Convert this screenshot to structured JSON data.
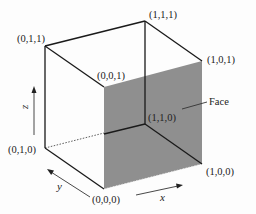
{
  "diagram": {
    "type": "unit-cube",
    "vertices": [
      {
        "id": "v000",
        "label": "(0,0,0)"
      },
      {
        "id": "v100",
        "label": "(1,0,0)"
      },
      {
        "id": "v010",
        "label": "(0,1,0)"
      },
      {
        "id": "v110",
        "label": "(1,1,0)"
      },
      {
        "id": "v001",
        "label": "(0,0,1)"
      },
      {
        "id": "v101",
        "label": "(1,0,1)"
      },
      {
        "id": "v011",
        "label": "(0,1,1)"
      },
      {
        "id": "v111",
        "label": "(1,1,1)"
      }
    ],
    "edges": [
      {
        "from": "(0,1,1)",
        "to": "(1,1,1)",
        "style": "solid"
      },
      {
        "from": "(1,1,1)",
        "to": "(1,0,1)",
        "style": "solid"
      },
      {
        "from": "(0,1,1)",
        "to": "(0,0,1)",
        "style": "solid"
      },
      {
        "from": "(0,1,1)",
        "to": "(0,1,0)",
        "style": "solid"
      },
      {
        "from": "(0,1,0)",
        "to": "(0,0,0)",
        "style": "solid"
      },
      {
        "from": "(1,1,1)",
        "to": "(1,1,0)",
        "style": "solid"
      },
      {
        "from": "(1,1,0)",
        "to": "(1,0,0)",
        "style": "solid"
      },
      {
        "from": "(1,1,0)",
        "to": "(0,0,1)-(0,0,0) face edge",
        "style": "solid"
      },
      {
        "from": "(0,1,0)",
        "to": "(1,1,0)",
        "style": "dotted"
      }
    ],
    "face": {
      "label": "Face",
      "vertices": [
        "(0,0,0)",
        "(1,0,0)",
        "(1,0,1)",
        "(0,0,1)"
      ],
      "color": "#8f8f8f"
    },
    "axes": [
      {
        "name": "x",
        "label": "x"
      },
      {
        "name": "y",
        "label": "y"
      },
      {
        "name": "z",
        "label": "z"
      }
    ]
  }
}
